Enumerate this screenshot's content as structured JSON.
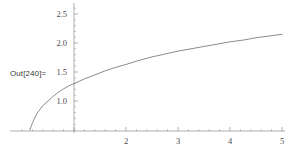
{
  "cell": {
    "out_label": "Out[240]="
  },
  "colors": {
    "background": "#ffffff",
    "axis": "#8d8d8d",
    "curve": "#6e6e6e",
    "tick_label": "#4a4a4a",
    "prompt_text": "#3a3a3a"
  },
  "chart_data": {
    "type": "line",
    "title": "",
    "xlabel": "",
    "ylabel": "",
    "xlim": [
      0,
      5
    ],
    "ylim": [
      0.48,
      2.62
    ],
    "grid": false,
    "legend": null,
    "x_ticks": [
      2,
      3,
      4,
      5
    ],
    "x_tick_labels": [
      "2",
      "3",
      "4",
      "5"
    ],
    "x_minor_tick_step": 0.2,
    "y_ticks": [
      1.0,
      1.5,
      2.0,
      2.5
    ],
    "y_tick_labels": [
      "1.0",
      "1.5",
      "2.0",
      "2.5"
    ],
    "y_minor_tick_step": 0.1,
    "series": [
      {
        "name": "curve",
        "x": [
          0.05,
          0.1,
          0.15,
          0.2,
          0.25,
          0.3,
          0.4,
          0.5,
          0.6,
          0.7,
          0.8,
          0.9,
          1.0,
          1.2,
          1.4,
          1.6,
          1.8,
          2.0,
          2.25,
          2.5,
          2.75,
          3.0,
          3.25,
          3.5,
          3.75,
          4.0,
          4.25,
          4.5,
          4.75,
          5.0
        ],
        "y": [
          0.0,
          0.32,
          0.5,
          0.62,
          0.72,
          0.8,
          0.92,
          1.0,
          1.08,
          1.15,
          1.21,
          1.26,
          1.3,
          1.38,
          1.45,
          1.52,
          1.58,
          1.63,
          1.7,
          1.76,
          1.81,
          1.86,
          1.9,
          1.94,
          1.98,
          2.02,
          2.05,
          2.09,
          2.12,
          2.15
        ]
      }
    ]
  }
}
